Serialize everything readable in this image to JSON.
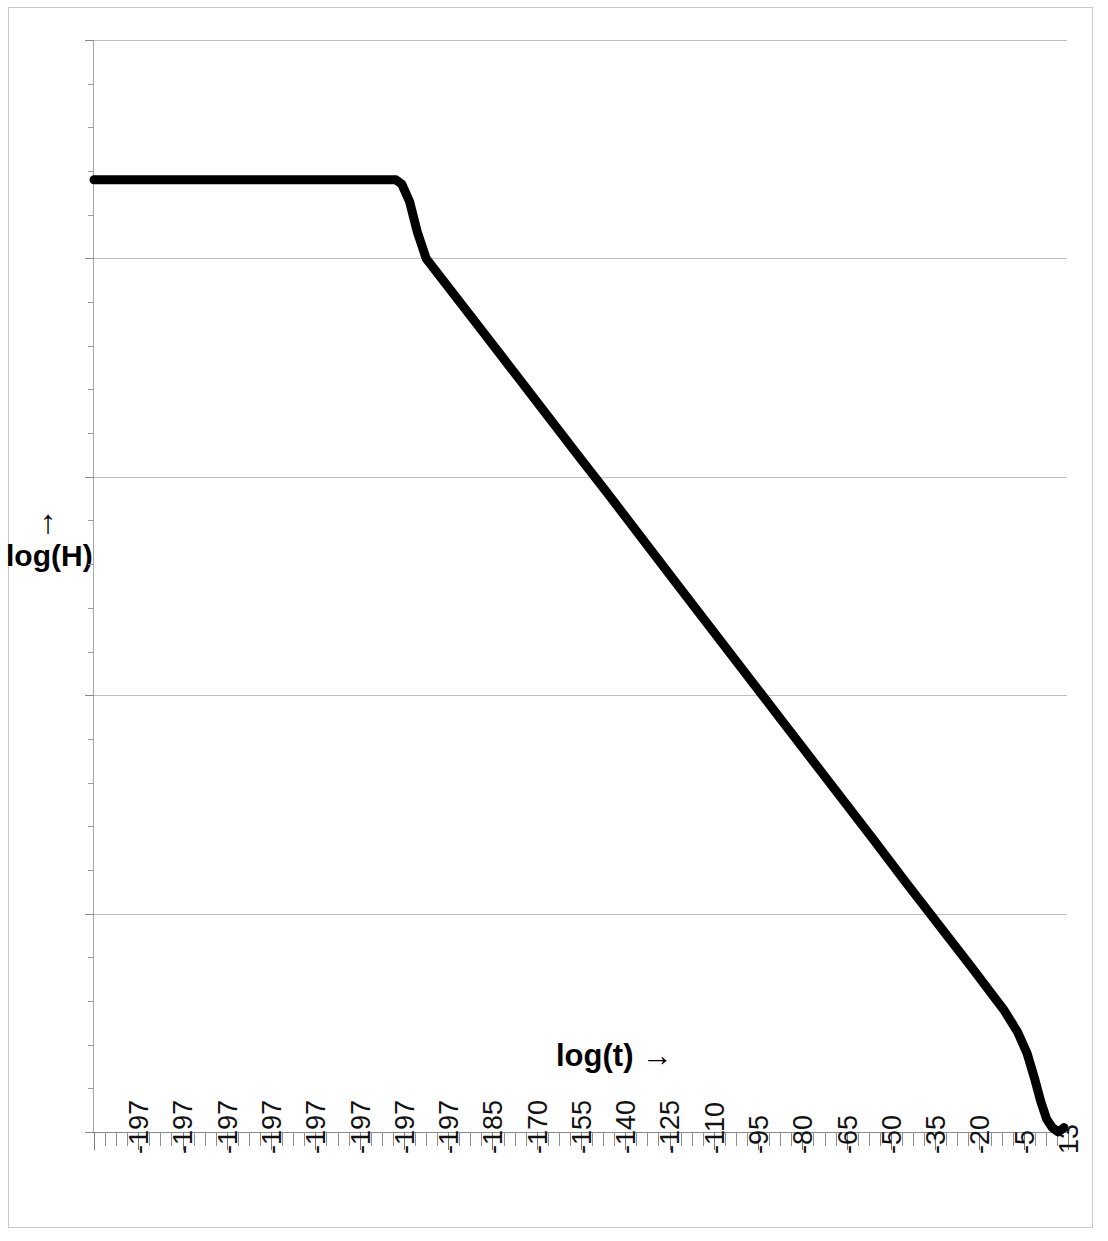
{
  "chart_data": {
    "type": "line",
    "title": "",
    "xlabel": "log(t)",
    "xlabel_arrow": "→",
    "ylabel": "log(H)",
    "ylabel_arrow": "↑",
    "ylim": [
      0,
      250
    ],
    "yticks": [
      0,
      50,
      100,
      150,
      200,
      250
    ],
    "ytick_labels": [
      "0",
      "50",
      "100",
      "150",
      "200",
      "250"
    ],
    "y_minor_step": 10,
    "grid": "horizontal",
    "legend": "none",
    "xtick_labels": [
      "-197",
      "-197",
      "-197",
      "-197",
      "-197",
      "-197",
      "-197",
      "-197",
      "-185",
      "-170",
      "-155",
      "-140",
      "-125",
      "-110",
      "-95",
      "-80",
      "-65",
      "-50",
      "-35",
      "-20",
      "-5",
      "13"
    ],
    "x_minor_ticks_between_labels": 3,
    "series": [
      {
        "name": "log(H)",
        "color": "#000000",
        "points": [
          [
            0.0,
            218
          ],
          [
            0.31,
            218
          ],
          [
            0.316,
            217
          ],
          [
            0.324,
            213
          ],
          [
            0.332,
            206
          ],
          [
            0.341,
            200
          ],
          [
            0.4,
            183
          ],
          [
            0.5,
            154
          ],
          [
            0.528,
            146
          ],
          [
            0.6,
            125
          ],
          [
            0.7,
            96
          ],
          [
            0.8,
            67
          ],
          [
            0.834,
            57
          ],
          [
            0.9,
            38
          ],
          [
            0.934,
            28
          ],
          [
            0.948,
            23
          ],
          [
            0.958,
            18
          ],
          [
            0.966,
            12
          ],
          [
            0.972,
            7
          ],
          [
            0.978,
            3
          ],
          [
            0.984,
            1
          ],
          [
            0.99,
            0
          ],
          [
            0.996,
            1
          ]
        ]
      }
    ]
  }
}
